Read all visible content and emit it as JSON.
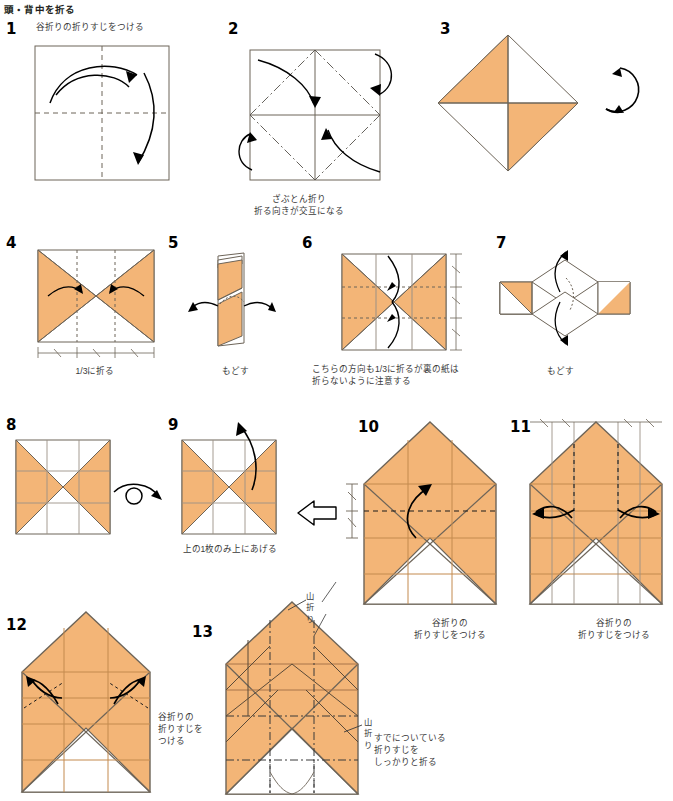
{
  "sheet": {
    "title": "頭・背中を折る",
    "paper_front_color": "#f3b577",
    "paper_back_color": "#ffffff",
    "line_color": "#6d6458",
    "crease_color": "#8a7f70",
    "arrow_color": "#000000",
    "text_color": "#3a3a3a"
  },
  "steps": [
    {
      "number": "1",
      "caption": "谷折りの折りすじをつける",
      "caption_position": "top",
      "figure": "square-with-center-creases-two-arcs"
    },
    {
      "number": "2",
      "caption": "ざぶとん折り\n折る向きが交互になる",
      "caption_position": "bottom",
      "furigana": "こうご",
      "figure": "square-with-diamond-dashdot-four-arrows"
    },
    {
      "number": "3",
      "caption": "",
      "caption_position": "none",
      "figure": "diamond-pinwheel",
      "rotate_icon": "circular-rotate-arrow"
    },
    {
      "number": "4",
      "caption": "1/3に折る",
      "caption_position": "bottom",
      "figure": "square-hourglass-two-inward-arrows",
      "measure": "thirds-horizontal"
    },
    {
      "number": "5",
      "caption": "もどす",
      "caption_position": "bottom",
      "figure": "narrow-vertical-strip-two-outward-arrows"
    },
    {
      "number": "6",
      "caption": "こちらの方向も1/3に折るが裏の紙は\n折らないように注意する",
      "caption_position": "bottom",
      "furigana": "うら",
      "figure": "square-hourglass-vertical-thirds-arrows",
      "measure": "thirds-vertical"
    },
    {
      "number": "7",
      "caption": "もどす",
      "caption_position": "bottom",
      "figure": "horizontal-strip-with-diamond-two-outward-arrows"
    },
    {
      "number": "8",
      "caption": "",
      "caption_position": "none",
      "figure": "square-hourglass-grid-thirds"
    },
    {
      "number": "9",
      "caption": "上の1枚のみ上にあげる",
      "caption_position": "bottom",
      "figure": "square-hourglass-grid-lift-arrow",
      "flip_icon": "turn-over-loop-arrow",
      "next_icon": "hollow-block-arrow"
    },
    {
      "number": "10",
      "caption": "谷折りの\n折りすじをつける",
      "caption_position": "bottom",
      "figure": "house-shape-with-fold-arrow",
      "measure": "equal-pair-left"
    },
    {
      "number": "11",
      "caption": "谷折りの\n折りすじをつける",
      "caption_position": "bottom",
      "figure": "house-shape-two-outward-arcs",
      "measure": "ticks-top"
    },
    {
      "number": "12",
      "caption": "谷折りの\n折りすじを\nつける",
      "caption_position": "right",
      "figure": "house-shape-two-outward-small-arcs"
    },
    {
      "number": "13",
      "caption": "すでについている\n折りすじを\nしっかりと折る",
      "caption_position": "right-bottom",
      "figure": "house-shape-full-crease-pattern",
      "labels": [
        {
          "text": "山折り",
          "position": "top-right"
        },
        {
          "text": "山折り",
          "position": "mid-right"
        }
      ]
    }
  ]
}
